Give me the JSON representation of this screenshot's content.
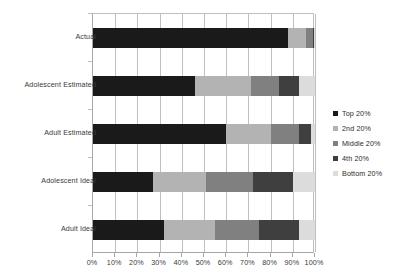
{
  "chart_data": {
    "type": "bar",
    "orientation": "horizontal",
    "stacked": true,
    "stack_total": 100,
    "title": "",
    "xlabel": "",
    "ylabel": "",
    "xlim": [
      0,
      100
    ],
    "grid": true,
    "legend_position": "right",
    "categories": [
      "Actual",
      "Adolescent Estimated",
      "Adult Estimated",
      "Adolescent Ideal",
      "Adult Ideal"
    ],
    "xticks": [
      "0%",
      "10%",
      "20%",
      "30%",
      "40%",
      "50%",
      "60%",
      "70%",
      "80%",
      "90%",
      "100%"
    ],
    "xtick_values": [
      0,
      10,
      20,
      30,
      40,
      50,
      60,
      70,
      80,
      90,
      100
    ],
    "series": [
      {
        "name": "Top 20%",
        "color": "#1a1a1a",
        "values": [
          88,
          46,
          60,
          27,
          32
        ]
      },
      {
        "name": "2nd 20%",
        "color": "#b3b3b3",
        "values": [
          8,
          25,
          20,
          24,
          23
        ]
      },
      {
        "name": "Middle 20%",
        "color": "#808080",
        "values": [
          3,
          13,
          13,
          21,
          20
        ]
      },
      {
        "name": "4th 20%",
        "color": "#3f3f3f",
        "values": [
          0.6,
          9,
          5,
          18,
          18
        ]
      },
      {
        "name": "Bottom 20%",
        "color": "#dcdcdc",
        "values": [
          0.4,
          7,
          2,
          10,
          7
        ]
      }
    ]
  },
  "legend": {
    "items": [
      {
        "label": "Top 20%"
      },
      {
        "label": "2nd 20%"
      },
      {
        "label": "Middle 20%"
      },
      {
        "label": "4th 20%"
      },
      {
        "label": "Bottom 20%"
      }
    ]
  }
}
